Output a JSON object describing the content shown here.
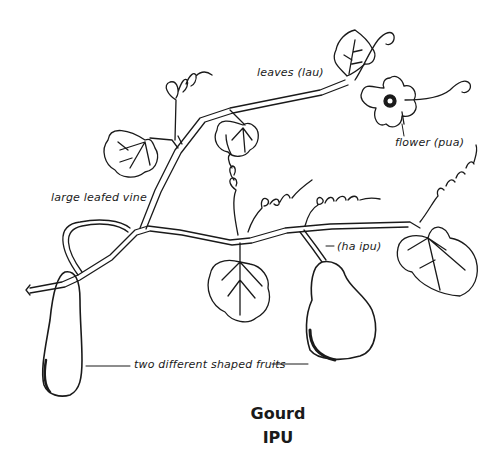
{
  "figure": {
    "title": "Gourd",
    "subtitle": "IPU",
    "labels": {
      "leaves": "leaves (lau)",
      "flower": "flower (pua)",
      "vine": "large leafed vine",
      "stem": "(ha ipu)",
      "fruits": "two different shaped fruits"
    },
    "colors": {
      "background": "#ffffff",
      "ink": "#1a1a1a"
    }
  }
}
